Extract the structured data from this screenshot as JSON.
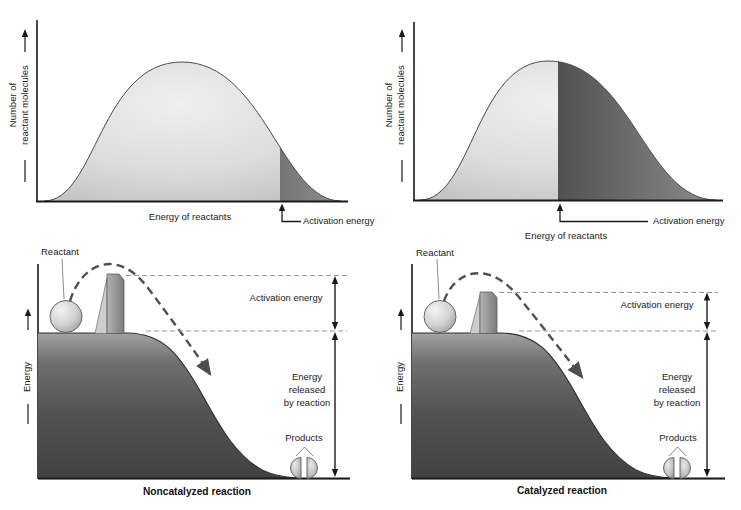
{
  "colors": {
    "text": "#1b1b1b",
    "axis": "#1a1a1a",
    "dome_light_fill": "#d8d8d8",
    "dome_dark_fill": "#4a4a4a",
    "hill_fill": "#4f4f4f",
    "dashed_reference_line": "#9a9a9a",
    "dashed_trajectory": "#4f4f4f"
  },
  "top_left_chart": {
    "y_axis_label": [
      "Number of",
      "reactant molecules"
    ],
    "x_axis_label": "Energy of reactants",
    "activation_label": "Activation energy"
  },
  "top_right_chart": {
    "y_axis_label": [
      "Number of",
      "reactant molecules"
    ],
    "x_axis_label": "Energy of reactants",
    "activation_label": "Activation energy"
  },
  "bottom_left_panel": {
    "y_axis_label": "Energy",
    "reactant_label": "Reactant",
    "activation_label": "Activation energy",
    "released_label_lines": [
      "Energy",
      "released",
      "by reaction"
    ],
    "products_label": "Products",
    "caption": "Noncatalyzed reaction"
  },
  "bottom_right_panel": {
    "y_axis_label": "Energy",
    "reactant_label": "Reactant",
    "activation_label": "Activation energy",
    "released_label_lines": [
      "Energy",
      "released",
      "by reaction"
    ],
    "products_label": "Products",
    "caption": "Catalyzed reaction"
  }
}
